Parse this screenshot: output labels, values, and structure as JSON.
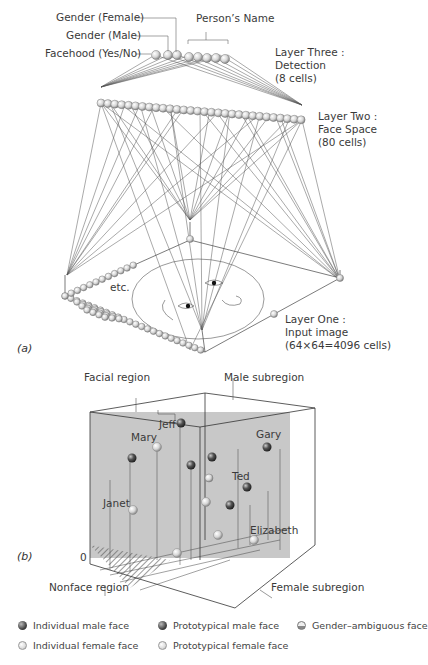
{
  "panel_a": {
    "label": "(a)",
    "output_labels": {
      "gender_female": "Gender (Female)",
      "gender_male": "Gender (Male)",
      "facehood": "Facehood (Yes/No)",
      "persons_name": "Person’s Name"
    },
    "layer_three": {
      "title": "Layer Three :",
      "name": "Detection",
      "cells": "(8 cells)"
    },
    "layer_two": {
      "title": "Layer Two :",
      "name": "Face Space",
      "cells": "(80 cells)"
    },
    "layer_one": {
      "title": "Layer One :",
      "name": "Input image",
      "cells": "(64×64=4096 cells)"
    },
    "etc": "etc."
  },
  "panel_b": {
    "label": "(b)",
    "facial_region": "Facial region",
    "male_subregion": "Male subregion",
    "female_subregion": "Female subregion",
    "nonface_region": "Nonface region",
    "origin": "0",
    "names": {
      "jeff": "Jeff",
      "mary": "Mary",
      "gary": "Gary",
      "ted": "Ted",
      "janet": "Janet",
      "elizabeth": "Elizabeth"
    },
    "region_color": "#c8c8c8"
  },
  "legend": {
    "items": [
      {
        "icon": "individual-male-face-icon",
        "label": "Individual male face"
      },
      {
        "icon": "prototypical-male-face-icon",
        "label": "Prototypical male face"
      },
      {
        "icon": "gender-ambiguous-face-icon",
        "label": "Gender–ambiguous face"
      },
      {
        "icon": "individual-female-face-icon",
        "label": "Individual female face"
      },
      {
        "icon": "prototypical-female-face-icon",
        "label": "Prototypical female face"
      }
    ]
  }
}
